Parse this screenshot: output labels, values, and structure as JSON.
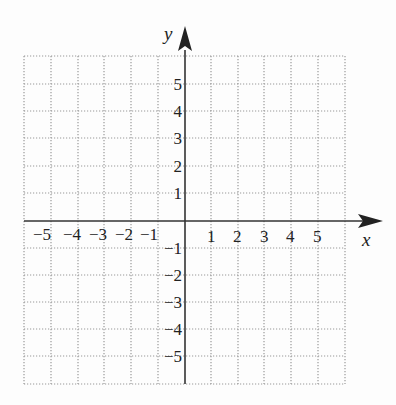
{
  "diagram": {
    "type": "coordinate-grid",
    "x_axis_label": "x",
    "y_axis_label": "y",
    "x_ticks": [
      {
        "value": -5,
        "label": "−5"
      },
      {
        "value": -4,
        "label": "−4"
      },
      {
        "value": -3,
        "label": "−3"
      },
      {
        "value": -2,
        "label": "−2"
      },
      {
        "value": -1,
        "label": "−1"
      },
      {
        "value": 1,
        "label": "1"
      },
      {
        "value": 2,
        "label": "2"
      },
      {
        "value": 3,
        "label": "3"
      },
      {
        "value": 4,
        "label": "4"
      },
      {
        "value": 5,
        "label": "5"
      }
    ],
    "y_ticks": [
      {
        "value": 5,
        "label": "5"
      },
      {
        "value": 4,
        "label": "4"
      },
      {
        "value": 3,
        "label": "3"
      },
      {
        "value": 2,
        "label": "2"
      },
      {
        "value": 1,
        "label": "1"
      },
      {
        "value": -1,
        "label": "−1"
      },
      {
        "value": -2,
        "label": "−2"
      },
      {
        "value": -3,
        "label": "−3"
      },
      {
        "value": -4,
        "label": "−4"
      },
      {
        "value": -5,
        "label": "−5"
      }
    ],
    "x_range": [
      -6,
      6
    ],
    "y_range": [
      -6,
      6
    ],
    "grid": "dotted",
    "colors": {
      "axis": "#333333",
      "grid": "#999999",
      "background": "#fdfdfd"
    }
  }
}
